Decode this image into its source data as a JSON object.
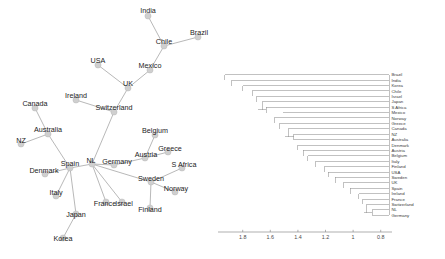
{
  "figure": {
    "panels": [
      "network-graph",
      "dendrogram"
    ]
  },
  "network": {
    "name": "country-network-graph",
    "nodes": [
      {
        "id": "India",
        "label": "India",
        "x": 148,
        "y": 16,
        "lx": 148,
        "ly": 13
      },
      {
        "id": "Brazil",
        "label": "Brazil",
        "x": 198,
        "y": 37,
        "lx": 199,
        "ly": 35
      },
      {
        "id": "Chile",
        "label": "Chile",
        "x": 164,
        "y": 46,
        "lx": 164,
        "ly": 44
      },
      {
        "id": "Mexico",
        "label": "Mexico",
        "x": 150,
        "y": 70,
        "lx": 150,
        "ly": 68
      },
      {
        "id": "USA",
        "label": "USA",
        "x": 98,
        "y": 65,
        "lx": 98,
        "ly": 63
      },
      {
        "id": "UK",
        "label": "UK",
        "x": 128,
        "y": 88,
        "lx": 128,
        "ly": 86
      },
      {
        "id": "Ireland",
        "label": "Ireland",
        "x": 76,
        "y": 100,
        "lx": 76,
        "ly": 98
      },
      {
        "id": "Switzerland",
        "label": "Switzerland",
        "x": 114,
        "y": 112,
        "lx": 114,
        "ly": 110
      },
      {
        "id": "Canada",
        "label": "Canada",
        "x": 35,
        "y": 108,
        "lx": 35,
        "ly": 106
      },
      {
        "id": "Australia",
        "label": "Australia",
        "x": 48,
        "y": 134,
        "lx": 48,
        "ly": 132
      },
      {
        "id": "NZ",
        "label": "NZ",
        "x": 21,
        "y": 144,
        "lx": 21,
        "ly": 143
      },
      {
        "id": "Belgium",
        "label": "Belgium",
        "x": 155,
        "y": 135,
        "lx": 155,
        "ly": 133
      },
      {
        "id": "Greece",
        "label": "Greece",
        "x": 168,
        "y": 152,
        "lx": 170,
        "ly": 151
      },
      {
        "id": "Austria",
        "label": "Austria",
        "x": 145,
        "y": 158,
        "lx": 146,
        "ly": 157
      },
      {
        "id": "Germany",
        "label": "Germany",
        "x": 114,
        "y": 165,
        "lx": 117,
        "ly": 164
      },
      {
        "id": "NL",
        "label": "NL",
        "x": 92,
        "y": 164,
        "lx": 91,
        "ly": 163
      },
      {
        "id": "Spain",
        "label": "Spain",
        "x": 70,
        "y": 168,
        "lx": 70,
        "ly": 166
      },
      {
        "id": "Denmark",
        "label": "Denmark",
        "x": 45,
        "y": 174,
        "lx": 44,
        "ly": 173
      },
      {
        "id": "S Africa",
        "label": "S Africa",
        "x": 182,
        "y": 168,
        "lx": 184,
        "ly": 167
      },
      {
        "id": "Sweden",
        "label": "Sweden",
        "x": 151,
        "y": 182,
        "lx": 151,
        "ly": 181
      },
      {
        "id": "Norway",
        "label": "Norway",
        "x": 175,
        "y": 192,
        "lx": 176,
        "ly": 191
      },
      {
        "id": "Italy",
        "label": "Italy",
        "x": 56,
        "y": 196,
        "lx": 56,
        "ly": 195
      },
      {
        "id": "France",
        "label": "France",
        "x": 106,
        "y": 202,
        "lx": 105,
        "ly": 206
      },
      {
        "id": "Israel",
        "label": "Israel",
        "x": 122,
        "y": 202,
        "lx": 124,
        "ly": 206
      },
      {
        "id": "Finland",
        "label": "Finland",
        "x": 150,
        "y": 208,
        "lx": 150,
        "ly": 212
      },
      {
        "id": "Japan",
        "label": "Japan",
        "x": 76,
        "y": 214,
        "lx": 76,
        "ly": 217
      },
      {
        "id": "Korea",
        "label": "Korea",
        "x": 63,
        "y": 238,
        "lx": 63,
        "ly": 241
      }
    ],
    "edges": [
      [
        "India",
        "Chile"
      ],
      [
        "Brazil",
        "Chile"
      ],
      [
        "Chile",
        "Mexico"
      ],
      [
        "Mexico",
        "UK"
      ],
      [
        "USA",
        "UK"
      ],
      [
        "UK",
        "Switzerland"
      ],
      [
        "Ireland",
        "Switzerland"
      ],
      [
        "Switzerland",
        "NL"
      ],
      [
        "Canada",
        "Australia"
      ],
      [
        "NZ",
        "Australia"
      ],
      [
        "Australia",
        "Spain"
      ],
      [
        "Spain",
        "NL"
      ],
      [
        "Denmark",
        "Spain"
      ],
      [
        "Italy",
        "Spain"
      ],
      [
        "Japan",
        "Spain"
      ],
      [
        "Korea",
        "Japan"
      ],
      [
        "NL",
        "Germany"
      ],
      [
        "Germany",
        "Austria"
      ],
      [
        "Austria",
        "Belgium"
      ],
      [
        "Austria",
        "Greece"
      ],
      [
        "NL",
        "France"
      ],
      [
        "NL",
        "Israel"
      ],
      [
        "NL",
        "Sweden"
      ],
      [
        "Sweden",
        "S Africa"
      ],
      [
        "Sweden",
        "Norway"
      ],
      [
        "Sweden",
        "Finland"
      ]
    ]
  },
  "chart_data": {
    "type": "dendrogram",
    "title": "",
    "xlabel": "",
    "ylabel": "",
    "orientation": "horizontal-right-labels",
    "axis": {
      "ticks": [
        "1.8",
        "1.6",
        "1.4",
        "1.2",
        "1",
        "0.8"
      ],
      "tick_values": [
        1.8,
        1.6,
        1.4,
        1.2,
        1.0,
        0.8
      ],
      "range": [
        1.95,
        0.74
      ],
      "direction": "decreasing-left-to-right",
      "grid": false
    },
    "leaf_labels": [
      "Brazil",
      "India",
      "Korea",
      "Chile",
      "Israel",
      "Japan",
      "S Africa",
      "Mexico",
      "Norway",
      "Greece",
      "Canada",
      "NZ",
      "Australia",
      "Denmark",
      "Austria",
      "Belgium",
      "Italy",
      "Finland",
      "USA",
      "Sweden",
      "UK",
      "Spain",
      "Ireland",
      "France",
      "Switzerland",
      "NL",
      "Germany"
    ],
    "leaf_heights": [
      1.93,
      1.88,
      1.8,
      1.73,
      1.7,
      1.66,
      1.63,
      1.51,
      1.57,
      1.53,
      1.47,
      1.43,
      1.43,
      1.4,
      1.36,
      1.33,
      1.27,
      1.21,
      1.18,
      1.13,
      1.07,
      1.02,
      0.96,
      0.93,
      0.9,
      0.86,
      0.86
    ],
    "merges": [
      {
        "height": 1.93,
        "note": "Brazil joins rest"
      },
      {
        "height": 1.88,
        "note": "India joins rest"
      },
      {
        "height": 1.8,
        "note": "Korea joins rest"
      },
      {
        "height": 1.73,
        "note": "Chile joins rest"
      },
      {
        "height": 1.7,
        "note": "Israel joins rest"
      },
      {
        "height": 1.66,
        "note": "Japan joins rest"
      },
      {
        "height": 1.63,
        "note": "S Africa + Mexico cluster joins"
      },
      {
        "height": 1.51,
        "note": "S Africa and Mexico merge"
      },
      {
        "height": 1.57,
        "note": "Norway joins rest"
      },
      {
        "height": 1.53,
        "note": "Greece joins rest"
      },
      {
        "height": 1.47,
        "note": "Canada joins rest"
      },
      {
        "height": 1.43,
        "note": "NZ and Australia merge"
      },
      {
        "height": 1.4,
        "note": "Denmark joins rest"
      },
      {
        "height": 1.36,
        "note": "Austria joins rest"
      },
      {
        "height": 1.33,
        "note": "Belgium joins rest"
      },
      {
        "height": 1.27,
        "note": "Italy joins rest"
      },
      {
        "height": 1.21,
        "note": "Finland joins rest"
      },
      {
        "height": 1.18,
        "note": "USA joins rest"
      },
      {
        "height": 1.13,
        "note": "Sweden joins rest"
      },
      {
        "height": 1.07,
        "note": "UK joins rest"
      },
      {
        "height": 1.02,
        "note": "Spain joins rest"
      },
      {
        "height": 0.96,
        "note": "Ireland joins rest"
      },
      {
        "height": 0.93,
        "note": "France joins rest"
      },
      {
        "height": 0.9,
        "note": "Switzerland joins rest"
      },
      {
        "height": 0.86,
        "note": "NL and Germany merge"
      }
    ]
  }
}
